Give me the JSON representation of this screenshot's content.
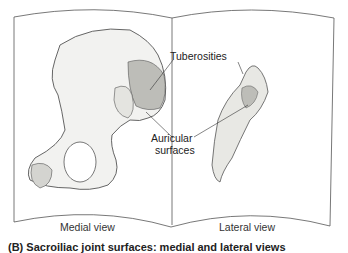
{
  "labels": {
    "tuberosities": "Tuberosities",
    "auricular_line1": "Auricular",
    "auricular_line2": "surfaces"
  },
  "views": {
    "left": "Medial view",
    "right": "Lateral view"
  },
  "caption": "(B) Sacroiliac joint surfaces: medial and lateral views",
  "colors": {
    "line": "#555555",
    "bone_fill": "#f2f2f0",
    "tuberosity_fill": "#bdbdb8",
    "text": "#222222"
  }
}
